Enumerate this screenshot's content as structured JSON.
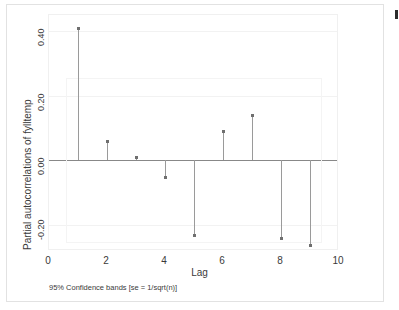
{
  "chart_data": {
    "type": "bar",
    "subtype": "stem-correlogram",
    "title": "",
    "xlabel": "Lag",
    "ylabel": "Partial autocorrelations of fylltemp",
    "note": "95% Confidence bands [se = 1/sqrt(n)]",
    "categories": [
      1,
      2,
      3,
      4,
      5,
      6,
      7,
      8,
      9
    ],
    "x": [
      1,
      2,
      3,
      4,
      5,
      6,
      7,
      8,
      9
    ],
    "values": [
      0.41,
      0.06,
      0.01,
      -0.05,
      -0.23,
      0.09,
      0.14,
      -0.24,
      -0.26
    ],
    "series": [
      {
        "name": "Partial autocorrelation",
        "values": [
          0.41,
          0.06,
          0.01,
          -0.05,
          -0.23,
          0.09,
          0.14,
          -0.24,
          -0.26
        ]
      }
    ],
    "xlim": [
      0,
      10
    ],
    "ylim": [
      -0.28,
      0.45
    ],
    "xticks": [
      0,
      2,
      4,
      6,
      8,
      10
    ],
    "xtick_labels": [
      "0",
      "2",
      "4",
      "6",
      "8",
      "10"
    ],
    "yticks": [
      -0.2,
      0.0,
      0.2,
      0.4
    ],
    "ytick_labels": [
      "-0.20",
      "0.00",
      "0.20",
      "0.40"
    ],
    "grid": true,
    "legend": "none",
    "confidence_band": {
      "label": "95% Confidence bands [se = 1/sqrt(n)]",
      "upper": 0.255,
      "lower": -0.255,
      "x_start": 0.6,
      "x_end": 9.4
    },
    "colors": {
      "marker": "#6f6f6f",
      "stem": "#9a9a9a",
      "zero_line": "#888888",
      "grid": "#f2f2f2",
      "band": "#f4f4f4",
      "background": "#ffffff",
      "text": "#3a3a3a"
    }
  },
  "axes": {
    "y_title": "Partial autocorrelations of fylltemp",
    "x_title": "Lag",
    "y_tick_labels": [
      "0.40",
      "0.20",
      "0.00",
      "-0.20"
    ],
    "x_tick_labels": [
      "0",
      "2",
      "4",
      "6",
      "8",
      "10"
    ]
  },
  "footer": {
    "note": "95% Confidence bands [se = 1/sqrt(n)]"
  }
}
